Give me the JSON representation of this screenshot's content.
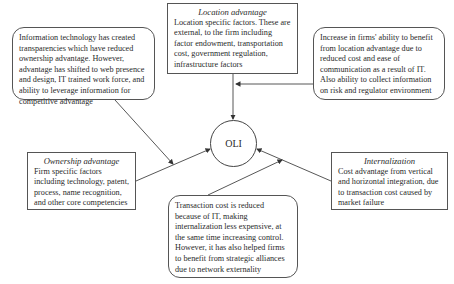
{
  "center": {
    "label": "OLI"
  },
  "boxes": {
    "it_ownership": {
      "text": "Information technology has created transparencies which have reduced ownership advantage. However, advantage has shifted to web presence and design, IT trained work force, and ability to leverage information for competitive advantage"
    },
    "location": {
      "title": "Location advantage",
      "text": "Location specific factors. These are external, to the firm including factor endowment, transportation cost, government regulation, infrastructure factors"
    },
    "it_location": {
      "text": "Increase in firms' ability to benefit from location advantage due to reduced cost and ease of communication as a result of IT. Also ability to collect information on risk and regulator environment"
    },
    "ownership": {
      "title": "Ownership advantage",
      "text": "Firm specific factors including technology, patent, process, name recognition, and other core competencies"
    },
    "internalization": {
      "title": "Internalization",
      "text": "Cost advantage from vertical and horizontal integration, due to transaction cost caused by market failure"
    },
    "it_internalization": {
      "text": "Transaction cost is reduced because of IT, making internalization less expensive, at the same time increasing control. However, it has also helped firms to benefit from strategic alliances due to network externality"
    }
  },
  "colors": {
    "line": "#444444",
    "border": "#555555",
    "text": "#2a2a2a"
  }
}
